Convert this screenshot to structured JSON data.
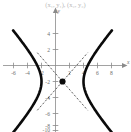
{
  "title": {
    "text": "(x₁, y₁), (x₂, y₂)"
  },
  "axes": {
    "x_name": "x",
    "y_name": "y",
    "x_tick_labels": [
      "-6",
      "-4",
      "-2",
      "2",
      "4",
      "6",
      "8"
    ],
    "y_tick_labels": [
      "4",
      "2",
      "-2",
      "-4",
      "-6",
      "-8",
      "-10"
    ]
  },
  "colors": {
    "curve": "#0b0b0b",
    "axis": "#8a8a8a",
    "asymptote": "#2a2a2a",
    "label": "#6f6f6f",
    "background": "#ffffff",
    "title": "#b9b9b9"
  },
  "chart_data": {
    "type": "line",
    "title": "(x₁, y₁), (x₂, y₂)",
    "xlabel": "x",
    "ylabel": "y",
    "xlim": [
      -7.2,
      9.4
    ],
    "ylim": [
      -10.4,
      4.9
    ],
    "grid": false,
    "legend": null,
    "xticks": [
      -6,
      -4,
      -2,
      2,
      4,
      6,
      8
    ],
    "yticks": [
      4,
      2,
      -2,
      -4,
      -6,
      -8,
      -10
    ],
    "curve_kind": "hyperbola-horizontal",
    "center": [
      1,
      -2
    ],
    "semi_axis_a": 3,
    "semi_axis_b": 3,
    "vertices": [
      [
        -2,
        -2
      ],
      [
        4,
        -2
      ]
    ],
    "asymptote_slopes": [
      1,
      -1
    ],
    "annotations": [
      {
        "kind": "point",
        "x": 1,
        "y": -2,
        "style": "filled-dot",
        "label": ""
      }
    ],
    "series": [
      {
        "name": "left-branch",
        "x": [
          -6.4,
          -6.0,
          -5.5,
          -5.0,
          -4.5,
          -4.0,
          -3.5,
          -3.2,
          -3.0,
          -2.6,
          -2.3,
          -2.1,
          -2.0,
          -2.1,
          -2.3,
          -2.6,
          -3.0,
          -3.2,
          -3.5,
          -4.0,
          -4.5,
          -5.0,
          -5.5,
          -6.0,
          -6.4
        ],
        "y": [
          4.9,
          4.4,
          3.9,
          3.4,
          2.8,
          2.2,
          1.5,
          1.0,
          0.6,
          -0.2,
          -1.0,
          -1.6,
          -2.0,
          -2.4,
          -3.0,
          -3.8,
          -4.6,
          -5.0,
          -5.5,
          -6.2,
          -6.8,
          -7.4,
          -7.9,
          -8.4,
          -8.9
        ]
      },
      {
        "name": "right-branch",
        "x": [
          8.4,
          8.0,
          7.5,
          7.0,
          6.5,
          6.0,
          5.5,
          5.2,
          5.0,
          4.6,
          4.3,
          4.1,
          4.0,
          4.1,
          4.3,
          4.6,
          5.0,
          5.2,
          5.5,
          6.0,
          6.5,
          7.0,
          7.5,
          8.0,
          8.4
        ],
        "y": [
          4.9,
          4.4,
          3.9,
          3.4,
          2.8,
          2.2,
          1.5,
          1.0,
          0.6,
          -0.2,
          -1.0,
          -1.6,
          -2.0,
          -2.4,
          -3.0,
          -3.8,
          -4.6,
          -5.0,
          -5.5,
          -6.2,
          -6.8,
          -7.4,
          -7.9,
          -8.4,
          -8.9
        ]
      },
      {
        "name": "asymptote-positive-slope",
        "x": [
          -2.6,
          4.6
        ],
        "y": [
          -5.6,
          1.6
        ],
        "style": "dashed"
      },
      {
        "name": "asymptote-negative-slope",
        "x": [
          -2.6,
          4.6
        ],
        "y": [
          1.6,
          -5.6
        ],
        "style": "dashed"
      }
    ]
  }
}
